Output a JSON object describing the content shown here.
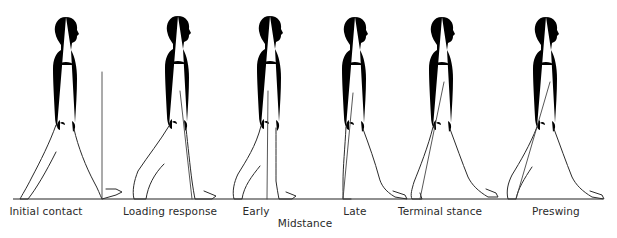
{
  "diagram": {
    "ground_line": true,
    "figures": [
      {
        "id": "initial-contact",
        "label": "Initial contact",
        "reference_line": "vertical line at heel"
      },
      {
        "id": "loading-response",
        "label": "Loading response",
        "reference_line": "line through limb"
      },
      {
        "id": "midstance-early",
        "label": "Early",
        "reference_line": "line through limb"
      },
      {
        "id": "midstance-late",
        "label": "Late",
        "reference_line": "line through limb"
      },
      {
        "id": "terminal-stance",
        "label": "Terminal stance",
        "reference_line": "inclined line through limb"
      },
      {
        "id": "preswing",
        "label": "Preswing",
        "reference_line": "inclined line through limb"
      }
    ],
    "group_label": "Midstance",
    "group_members": [
      "Early",
      "Late"
    ]
  }
}
